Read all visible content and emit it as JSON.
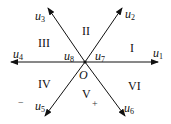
{
  "diagram": {
    "type": "six-sector vector diagram",
    "origin_label": "O",
    "vectors": [
      {
        "id": "u1",
        "base": "u",
        "sub": "1",
        "angle_deg": 0
      },
      {
        "id": "u2",
        "base": "u",
        "sub": "2",
        "angle_deg": 60
      },
      {
        "id": "u3",
        "base": "u",
        "sub": "3",
        "angle_deg": 120
      },
      {
        "id": "u4",
        "base": "u",
        "sub": "4",
        "angle_deg": 180
      },
      {
        "id": "u5",
        "base": "u",
        "sub": "5",
        "angle_deg": 240
      },
      {
        "id": "u6",
        "base": "u",
        "sub": "6",
        "angle_deg": 300
      }
    ],
    "zero_vectors": [
      {
        "id": "u7",
        "base": "u",
        "sub": "7"
      },
      {
        "id": "u8",
        "base": "u",
        "sub": "8"
      }
    ],
    "sectors": [
      "I",
      "II",
      "III",
      "IV",
      "V",
      "VI"
    ],
    "signs": {
      "minus": "−",
      "plus": "+"
    },
    "line_color": "#111111"
  }
}
